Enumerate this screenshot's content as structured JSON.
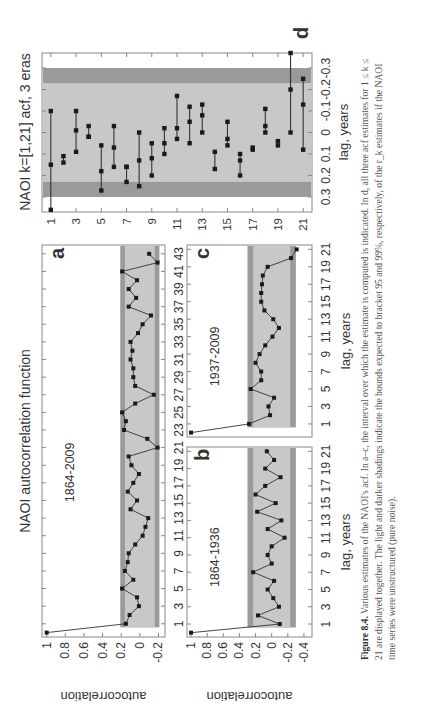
{
  "figure": {
    "main_title": "NAOI autocorrelation function",
    "caption_label": "Figure 8.4.",
    "caption_text": "Various estimates of the NAOI's acf. In a–c, the interval over which the estimate is computed is indicated. In d, all three acf estimates for 1 ≤ k ≤ 21 are displayed together. The light and darker shadings indicate the bounds expected to bracket 95 and 99%, respectively, of the r_k estimates if the NAOI time series were unstructured (pure noise).",
    "colors": {
      "light_band": "#c8c8c8",
      "dark_band": "#9a9a9a",
      "line": "#333333",
      "marker": "#1a1a1a",
      "axis": "#888888"
    }
  },
  "chart_data": [
    {
      "id": "a",
      "type": "line",
      "panel_label": "a",
      "annotation": "1864-2009",
      "xlabel": "",
      "ylabel": "autocorrelation",
      "x_ticks": [
        1,
        3,
        5,
        7,
        9,
        11,
        13,
        15,
        17,
        19,
        21,
        23,
        25,
        27,
        29,
        31,
        33,
        35,
        37,
        39,
        41,
        43
      ],
      "y_ticks": [
        1,
        0.8,
        0.6,
        0.4,
        0.2,
        0,
        -0.2
      ],
      "y_tick_labels": [
        "1",
        "0.8",
        "0.6",
        "0.4",
        "0.2",
        "0",
        "-0.2"
      ],
      "xlim": [
        -0.5,
        44
      ],
      "ylim": [
        -0.27,
        1.05
      ],
      "band95": [
        -0.16,
        0.16
      ],
      "band99": [
        -0.21,
        0.21
      ],
      "x": [
        0,
        1,
        2,
        3,
        4,
        5,
        6,
        7,
        8,
        9,
        10,
        11,
        12,
        13,
        14,
        15,
        16,
        17,
        18,
        19,
        20,
        21,
        22,
        23,
        24,
        25,
        26,
        27,
        28,
        29,
        30,
        31,
        32,
        33,
        34,
        35,
        36,
        37,
        38,
        39,
        40,
        41,
        42,
        43
      ],
      "values": [
        1.0,
        0.15,
        0.11,
        0.01,
        0.03,
        0.19,
        0.07,
        0.16,
        0.13,
        0.12,
        0.05,
        -0.03,
        -0.06,
        -0.09,
        0.1,
        0.03,
        0.13,
        0.07,
        0.01,
        0.09,
        0.12,
        -0.19,
        -0.08,
        0.17,
        0.15,
        0.19,
        0.05,
        -0.15,
        0.05,
        0.07,
        0.07,
        0.1,
        0.08,
        0.1,
        0.02,
        -0.03,
        -0.12,
        0.12,
        0.04,
        0.12,
        0.03,
        0.19,
        -0.19,
        -0.1,
        -0.13
      ]
    },
    {
      "id": "b",
      "type": "line",
      "panel_label": "b",
      "annotation": "1864-1936",
      "xlabel": "lag, years",
      "ylabel": "autocorrelation",
      "x_ticks": [
        1,
        3,
        5,
        7,
        9,
        11,
        13,
        15,
        17,
        19,
        21
      ],
      "x_tick_labels": [
        "1",
        "3",
        "5",
        "7",
        "9",
        "11",
        "13",
        "15",
        "17",
        "19",
        "21"
      ],
      "y_ticks": [
        1,
        0.8,
        0.6,
        0.4,
        0.2,
        0,
        -0.2,
        -0.4
      ],
      "y_tick_labels": [
        "1",
        "0.8",
        "0.6",
        "0.4",
        "0.2",
        "0",
        "-0.2",
        "-0.4"
      ],
      "xlim": [
        -0.5,
        21.5
      ],
      "ylim": [
        -0.5,
        1.05
      ],
      "band95": [
        -0.23,
        0.23
      ],
      "band99": [
        -0.3,
        0.3
      ],
      "x": [
        0,
        1,
        2,
        3,
        4,
        5,
        6,
        7,
        8,
        9,
        10,
        11,
        12,
        13,
        14,
        15,
        16,
        17,
        18,
        19,
        20,
        21
      ],
      "values": [
        1.0,
        -0.1,
        0.17,
        -0.09,
        -0.02,
        0.05,
        -0.03,
        0.23,
        0.0,
        0.05,
        0.0,
        -0.16,
        0.05,
        -0.12,
        0.18,
        -0.05,
        0.2,
        0.08,
        -0.11,
        0.08,
        -0.03,
        0.06,
        -0.0
      ]
    },
    {
      "id": "c",
      "type": "line",
      "panel_label": "c",
      "annotation": "1937-2009",
      "xlabel": "lag, years",
      "ylabel": "",
      "x_ticks": [
        1,
        3,
        5,
        7,
        9,
        11,
        13,
        15,
        17,
        19,
        21
      ],
      "x_tick_labels": [
        "1",
        "3",
        "5",
        "7",
        "9",
        "11",
        "13",
        "15",
        "17",
        "19",
        "21"
      ],
      "xlim": [
        -0.5,
        21.5
      ],
      "ylim": [
        -0.5,
        1.05
      ],
      "band95": [
        -0.23,
        0.23
      ],
      "band99": [
        -0.3,
        0.3
      ],
      "x": [
        0,
        1,
        2,
        3,
        4,
        5,
        6,
        7,
        8,
        9,
        10,
        11,
        12,
        13,
        14,
        15,
        16,
        17,
        18,
        19,
        20,
        21
      ],
      "values": [
        1.0,
        0.28,
        0.02,
        0.04,
        -0.03,
        0.26,
        0.13,
        0.13,
        0.2,
        0.15,
        0.08,
        -0.01,
        -0.09,
        -0.02,
        0.09,
        0.13,
        0.13,
        0.12,
        0.11,
        0.05,
        -0.24,
        -0.31,
        0.17
      ]
    },
    {
      "id": "d",
      "type": "scatter",
      "panel_label": "d",
      "title": "NAOI k=[1,21] acf, 3 eras",
      "xlabel": "lag, years",
      "ylabel": "",
      "x_ticks": [
        1,
        3,
        5,
        7,
        9,
        11,
        13,
        15,
        17,
        19,
        21
      ],
      "x_tick_labels": [
        "1",
        "3",
        "5",
        "7",
        "9",
        "11",
        "13",
        "15",
        "17",
        "19",
        "21"
      ],
      "y_ticks": [
        0.3,
        0.2,
        0.1,
        0,
        -0.1,
        -0.2,
        -0.3
      ],
      "y_tick_labels": [
        "0.3",
        "0.2",
        "0.1",
        "0",
        "-0.1",
        "-0.2",
        "-0.3"
      ],
      "xlim": [
        0.3,
        21.7
      ],
      "ylim": [
        -0.37,
        0.37
      ],
      "y_inverted": true,
      "band95": [
        -0.23,
        0.23
      ],
      "band99": [
        -0.3,
        0.3
      ],
      "lags": [
        1,
        2,
        3,
        4,
        5,
        6,
        7,
        8,
        9,
        10,
        11,
        12,
        13,
        14,
        15,
        16,
        17,
        18,
        19,
        20,
        21
      ],
      "estimates": [
        [
          0.36,
          0.15,
          -0.1
        ],
        [
          0.14,
          0.11
        ],
        [
          0.09,
          -0.01,
          -0.1
        ],
        [
          0.02,
          0.02,
          -0.03
        ],
        [
          0.27,
          0.18,
          0.06
        ],
        [
          0.16,
          0.07,
          -0.03
        ],
        [
          0.23,
          0.16,
          0.16
        ],
        [
          0.25,
          0.13,
          0.0
        ],
        [
          0.2,
          0.12,
          0.05
        ],
        [
          0.1,
          0.05,
          -0.02
        ],
        [
          0.03,
          -0.02,
          -0.17
        ],
        [
          0.05,
          -0.05,
          -0.12
        ],
        [
          0.0,
          -0.08,
          -0.13
        ],
        [
          0.17,
          0.09
        ],
        [
          0.06,
          0.03,
          -0.05
        ],
        [
          0.2,
          0.13,
          0.1
        ],
        [
          0.08,
          0.07
        ],
        [
          0.0,
          -0.03,
          -0.11
        ],
        [
          0.06,
          0.04
        ],
        [
          0.0,
          -0.2,
          -0.37
        ],
        [
          0.08,
          -0.13,
          -0.25
        ]
      ]
    }
  ]
}
